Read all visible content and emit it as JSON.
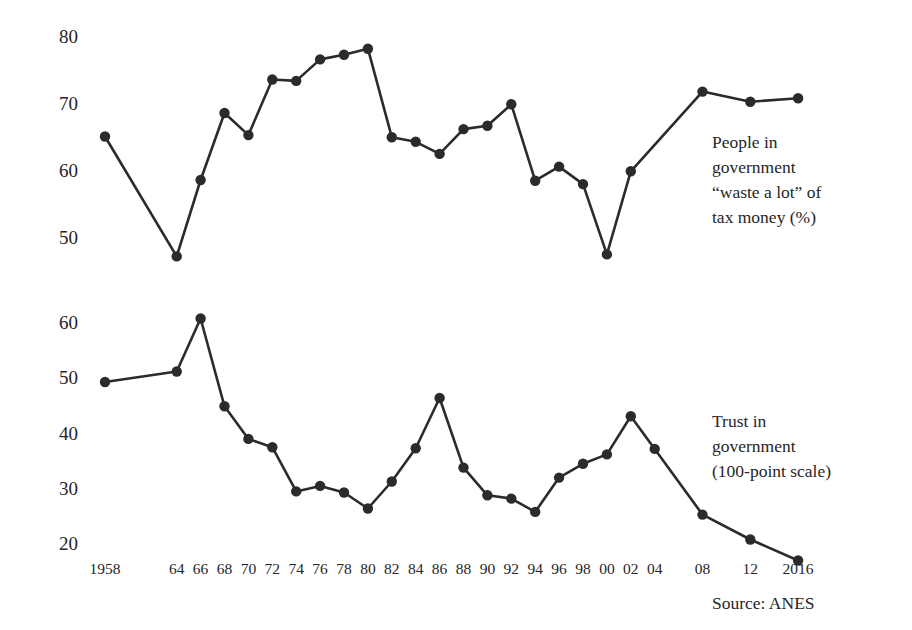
{
  "chart_data": {
    "type": "line",
    "title": "",
    "subtitle": "",
    "xlabel": "",
    "ylabel": "",
    "grid": false,
    "legend_position": "inline-right-annotations",
    "source": "Source: ANES",
    "x": [
      1958,
      1964,
      1966,
      1968,
      1970,
      1972,
      1974,
      1976,
      1978,
      1980,
      1982,
      1984,
      1986,
      1988,
      1990,
      1992,
      1994,
      1996,
      1998,
      2000,
      2002,
      2004,
      2008,
      2012,
      2016
    ],
    "x_tick_labels": [
      "1958",
      "64",
      "66",
      "68",
      "70",
      "72",
      "74",
      "76",
      "78",
      "80",
      "82",
      "84",
      "86",
      "88",
      "90",
      "92",
      "94",
      "96",
      "98",
      "00",
      "02",
      "04",
      "08",
      "12",
      "2016"
    ],
    "panels": [
      {
        "name": "waste",
        "annotation": "People in\ngovernment\n“waste a lot” of\ntax money (%)",
        "annotation_lines": [
          "People in",
          "government",
          "“waste a lot” of",
          "tax money (%)"
        ],
        "y_ticks": [
          50,
          60,
          70,
          80
        ],
        "y_tick_labels": [
          "50",
          "60",
          "70",
          "80"
        ],
        "ylim": [
          44,
          82
        ],
        "values": [
          65.3,
          47.4,
          58.8,
          68.8,
          65.5,
          73.8,
          73.6,
          76.8,
          77.5,
          78.4,
          65.2,
          64.5,
          62.7,
          66.4,
          66.9,
          70.1,
          58.7,
          60.8,
          58.2,
          47.7,
          60.1,
          72.0,
          70.5,
          71.0
        ],
        "value_x": [
          1958,
          1964,
          1966,
          1968,
          1970,
          1972,
          1974,
          1976,
          1978,
          1980,
          1982,
          1984,
          1986,
          1988,
          1990,
          1992,
          1994,
          1996,
          1998,
          2000,
          2002,
          2008,
          2012,
          2016
        ]
      },
      {
        "name": "trust",
        "annotation": "Trust in\ngovernment\n(100-point scale)",
        "annotation_lines": [
          "Trust in",
          "government",
          "(100-point scale)"
        ],
        "y_ticks": [
          20,
          30,
          40,
          50,
          60
        ],
        "y_tick_labels": [
          "20",
          "30",
          "40",
          "50",
          "60"
        ],
        "ylim": [
          15,
          64
        ],
        "values": [
          49.5,
          51.4,
          61.0,
          45.1,
          39.2,
          37.7,
          29.7,
          30.7,
          29.5,
          26.6,
          31.5,
          37.5,
          46.6,
          34.0,
          29.0,
          28.4,
          26.0,
          32.2,
          34.7,
          36.4,
          43.3,
          37.4,
          25.5,
          21.0,
          17.2
        ],
        "value_x": [
          1958,
          1964,
          1966,
          1968,
          1970,
          1972,
          1974,
          1976,
          1978,
          1980,
          1982,
          1984,
          1986,
          1988,
          1990,
          1992,
          1994,
          1996,
          1998,
          2000,
          2002,
          2004,
          2008,
          2012,
          2016
        ]
      }
    ],
    "colors": {
      "line": "#2b2b2b",
      "marker": "#2b2b2b",
      "text": "#262626",
      "background": "#ffffff"
    }
  }
}
